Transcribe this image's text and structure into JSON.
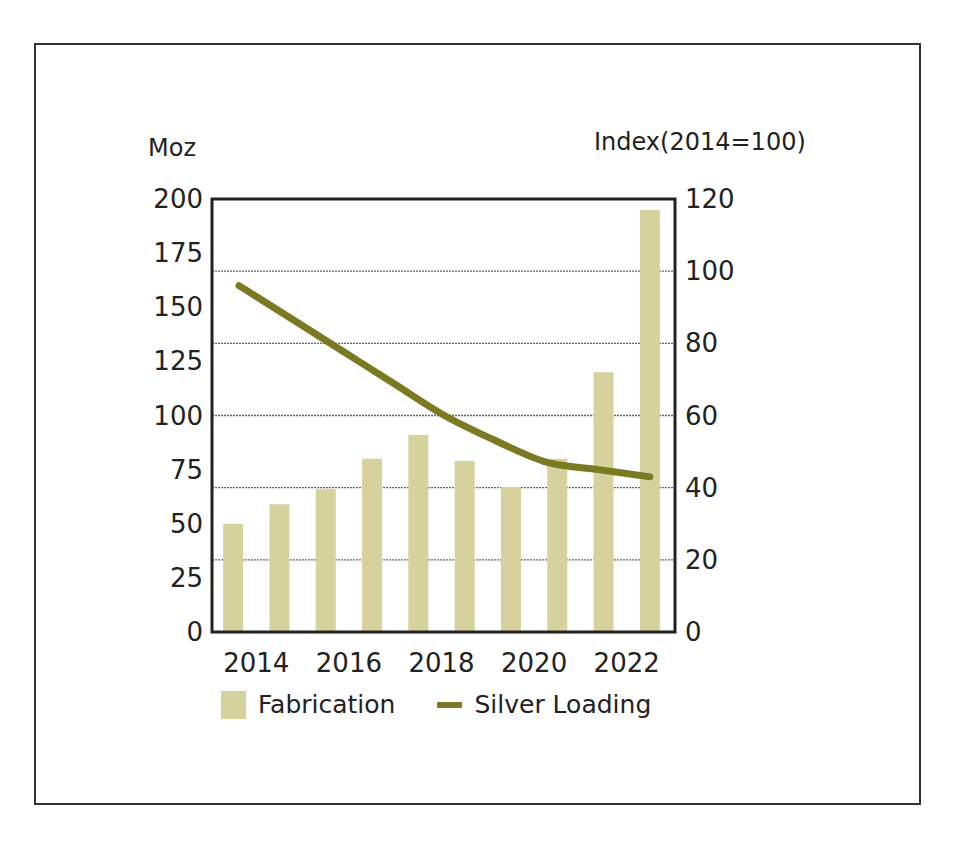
{
  "chart_data": {
    "type": "bar",
    "title": "",
    "xlabel": "",
    "ylabel": "Moz",
    "y2label": "Index(2014=100)",
    "x_tick_labels": [
      "2014",
      "2016",
      "2018",
      "2020",
      "2022"
    ],
    "categories": [
      "2014",
      "2015",
      "2016",
      "2017",
      "2018",
      "2019",
      "2020",
      "2021",
      "2022",
      "2023"
    ],
    "ylim": [
      0,
      200
    ],
    "y_ticks": [
      0,
      25,
      50,
      75,
      100,
      125,
      150,
      175,
      200
    ],
    "y2lim": [
      0,
      120
    ],
    "y2_ticks": [
      0,
      20,
      40,
      60,
      80,
      100,
      120
    ],
    "grid": "horizontal, aligned with right axis",
    "legend_position": "bottom",
    "series": [
      {
        "name": "Fabrication",
        "type": "bar",
        "axis": "left",
        "color": "#d6d29e",
        "values": [
          50,
          59,
          66,
          80,
          91,
          79,
          67,
          80,
          120,
          195
        ]
      },
      {
        "name": "Silver Loading",
        "type": "line",
        "axis": "right",
        "color": "#7b7a22",
        "x": [
          "2014",
          "2015",
          "2016",
          "2017",
          "2018",
          "2019",
          "2020",
          "2021",
          "2022"
        ],
        "values": [
          96,
          87,
          78,
          69,
          60,
          53,
          47,
          45,
          43
        ]
      }
    ]
  },
  "labels": {
    "left_axis_title": "Moz",
    "right_axis_title": "Index(2014=100)"
  },
  "legend": {
    "items": [
      {
        "label": "Fabrication",
        "color": "#d6d29e"
      },
      {
        "label": "Silver Loading",
        "color": "#7b7a22"
      }
    ]
  }
}
